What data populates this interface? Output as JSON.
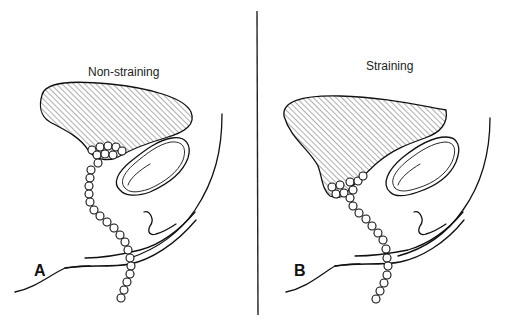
{
  "figure": {
    "panels": [
      {
        "id": "A",
        "letter": "A",
        "caption": "Non-straining"
      },
      {
        "id": "B",
        "letter": "B",
        "caption": "Straining"
      }
    ],
    "divider": "vertical rule between panels",
    "colors": {
      "ink": "#111111",
      "background": "#ffffff"
    }
  }
}
